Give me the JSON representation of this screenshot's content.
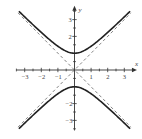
{
  "chart_data": {
    "type": "line",
    "title": "",
    "xlabel": "x",
    "ylabel": "y",
    "xlim": [
      -3.5,
      3.7
    ],
    "ylim": [
      -3.6,
      3.7
    ],
    "grid": false,
    "legend": null,
    "x_ticks": [
      -3,
      -2,
      -1,
      1,
      2,
      3
    ],
    "x_tick_labels": [
      "−3",
      "−2",
      "−1",
      "1",
      "2",
      "3"
    ],
    "y_ticks": [
      -3,
      -2,
      2,
      3
    ],
    "y_tick_labels": [
      "−3",
      "−2",
      "2",
      "3"
    ],
    "series": [
      {
        "name": "hyperbola upper branch",
        "equation": "y = sqrt(1 + x^2)",
        "style": "solid",
        "color": "#222222"
      },
      {
        "name": "hyperbola lower branch",
        "equation": "y = -sqrt(1 + x^2)",
        "style": "solid",
        "color": "#222222"
      },
      {
        "name": "asymptote",
        "equation": "y = x",
        "style": "dashed",
        "color": "#666666"
      },
      {
        "name": "asymptote",
        "equation": "y = -x",
        "style": "dashed",
        "color": "#666666"
      }
    ],
    "annotations": []
  }
}
